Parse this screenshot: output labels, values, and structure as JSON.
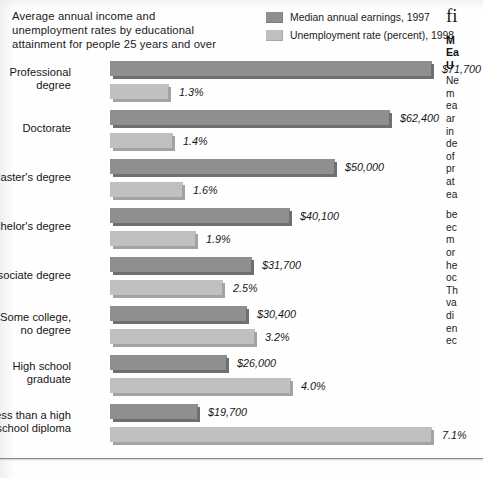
{
  "title": {
    "line1": "Average annual income and",
    "line2": "unemployment rates by educational",
    "line3": "attainment for people 25 years and over"
  },
  "legend": {
    "position": "top-right",
    "items": [
      {
        "label": "Median annual earnings, 1997",
        "color": "#8f8f8f",
        "swatch_name": "earnings-swatch"
      },
      {
        "label": "Unemployment rate (percent), 1998",
        "color": "#c0c0c0",
        "swatch_name": "unemployment-swatch"
      }
    ]
  },
  "sidebar": {
    "kicker": "fi",
    "heading_lines": [
      "M",
      "Ea",
      "U"
    ],
    "body_lines_1": [
      "Ne",
      "m",
      "ea",
      "ar",
      "in",
      "de",
      "of",
      "pr",
      "at",
      "ea"
    ],
    "body_lines_2": [
      "be",
      "ec",
      "m",
      "or",
      "he",
      "oc",
      "Th",
      "va",
      "di",
      "en",
      "ec"
    ]
  },
  "chart_data": {
    "type": "bar",
    "orientation": "horizontal",
    "title": "Average annual income and unemployment rates by educational attainment for people 25 years and over",
    "xlabel": "",
    "ylabel": "",
    "grid": false,
    "legend_position": "top-right",
    "categories": [
      "Professional degree",
      "Doctorate",
      "Master's degree",
      "Bachelor's degree",
      "Associate degree",
      "Some college, no degree",
      "High school graduate",
      "Less than a high school diploma"
    ],
    "category_lines": [
      [
        "Professional",
        "degree"
      ],
      [
        "Doctorate",
        ""
      ],
      [
        "Master's degree",
        ""
      ],
      [
        "Bachelor's degree",
        ""
      ],
      [
        "Associate degree",
        ""
      ],
      [
        "Some college,",
        "no degree"
      ],
      [
        "High school",
        "graduate"
      ],
      [
        "Less than a high",
        "school diploma"
      ]
    ],
    "series": [
      {
        "name": "Median annual earnings, 1997",
        "color": "#8f8f8f",
        "unit": "USD",
        "values": [
          71700,
          62400,
          50000,
          40100,
          31700,
          30400,
          26000,
          19700
        ],
        "labels": [
          "$71,700",
          "$62,400",
          "$50,000",
          "$40,100",
          "$31,700",
          "$30,400",
          "$26,000",
          "$19,700"
        ],
        "max": 71700
      },
      {
        "name": "Unemployment rate (percent), 1998",
        "color": "#c0c0c0",
        "unit": "percent",
        "values": [
          1.3,
          1.4,
          1.6,
          1.9,
          2.5,
          3.2,
          4.0,
          7.1
        ],
        "labels": [
          "1.3%",
          "1.4%",
          "1.6%",
          "1.9%",
          "2.5%",
          "3.2%",
          "4.0%",
          "7.1%"
        ],
        "max": 7.1
      }
    ]
  }
}
